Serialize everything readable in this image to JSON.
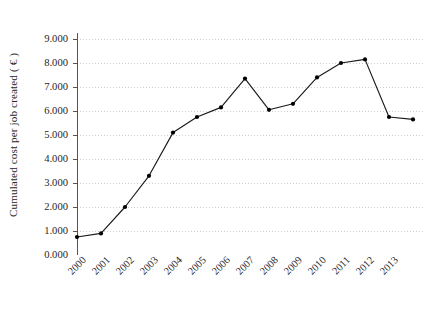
{
  "chart_data": {
    "type": "line",
    "title": "",
    "subtitle": "",
    "xlabel": "",
    "ylabel": "Cumulated cost per job created ( € )",
    "categories": [
      "2000",
      "2001",
      "2002",
      "2003",
      "2004",
      "2005",
      "2006",
      "2007",
      "2008",
      "2009",
      "2010",
      "2011",
      "2012",
      "2013",
      ""
    ],
    "values": [
      0.75,
      0.9,
      2.0,
      3.3,
      5.1,
      5.75,
      6.15,
      7.35,
      6.05,
      6.3,
      7.4,
      8.0,
      8.15,
      5.75,
      5.65
    ],
    "ylim": [
      0,
      9
    ],
    "ytick_labels": [
      "0.000",
      "1.000",
      "2.000",
      "3.000",
      "4.000",
      "5.000",
      "6.000",
      "7.000",
      "8.000",
      "9.000"
    ],
    "ytick_values": [
      0,
      1,
      2,
      3,
      4,
      5,
      6,
      7,
      8,
      9
    ],
    "xtick_labels": [
      "2000",
      "2001",
      "2002",
      "2003",
      "2004",
      "2005",
      "2006",
      "2007",
      "2008",
      "2009",
      "2010",
      "2011",
      "2012",
      "2013"
    ],
    "grid": "horizontal-dotted",
    "legend": "none",
    "series": [
      {
        "name": "Cumulated cost per job created",
        "values": [
          0.75,
          0.9,
          2.0,
          3.3,
          5.1,
          5.75,
          6.15,
          7.35,
          6.05,
          6.3,
          7.4,
          8.0,
          8.15,
          5.75,
          5.65
        ]
      }
    ],
    "colors": {
      "line": "#1a1a1a",
      "marker": "#000000",
      "grid": "#cfcfcf",
      "axis": "#555555",
      "background": "#ffffff",
      "text": "#1f1f1f"
    }
  }
}
